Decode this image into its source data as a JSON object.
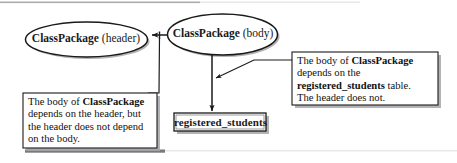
{
  "diagram": {
    "type": "dependency-diagram",
    "background_color": "#ffffff",
    "stroke_color": "#1a1a1a",
    "shadow_color": "#9a9a9a",
    "nodes": [
      {
        "id": "header-ellipse",
        "shape": "ellipse",
        "name_bold": "ClassPackage",
        "qualifier": " (header)"
      },
      {
        "id": "body-ellipse",
        "shape": "ellipse",
        "name_bold": "ClassPackage",
        "qualifier": " (body)"
      },
      {
        "id": "table-node",
        "shape": "rectangle",
        "label": "registered_students"
      }
    ],
    "notes": [
      {
        "id": "left-note",
        "lines": [
          {
            "segments": [
              {
                "text": "The body of ",
                "bold": false
              },
              {
                "text": "ClassPackage",
                "bold": true
              }
            ]
          },
          {
            "segments": [
              {
                "text": "depends on the header, but",
                "bold": false
              }
            ]
          },
          {
            "segments": [
              {
                "text": "the header does not depend",
                "bold": false
              }
            ]
          },
          {
            "segments": [
              {
                "text": "on the body.",
                "bold": false
              }
            ]
          }
        ]
      },
      {
        "id": "right-note",
        "lines": [
          {
            "segments": [
              {
                "text": "The body of ",
                "bold": false
              },
              {
                "text": "ClassPackage",
                "bold": true
              }
            ]
          },
          {
            "segments": [
              {
                "text": "depends on the",
                "bold": false
              }
            ]
          },
          {
            "segments": [
              {
                "text": "registered_students",
                "bold": true
              },
              {
                "text": " table.",
                "bold": false
              }
            ]
          },
          {
            "segments": [
              {
                "text": "The header does not.",
                "bold": false
              }
            ]
          }
        ]
      }
    ],
    "edges": [
      {
        "id": "body-to-header",
        "from": "body-ellipse",
        "to": "header-ellipse",
        "arrow": true
      },
      {
        "id": "body-to-table",
        "from": "body-ellipse",
        "to": "table-node",
        "arrow": true
      },
      {
        "id": "left-note-leader",
        "from": "left-note",
        "to": "body-to-header",
        "arrow": false
      },
      {
        "id": "right-note-leader",
        "from": "right-note",
        "to": "body-to-table",
        "arrow": true
      }
    ]
  }
}
